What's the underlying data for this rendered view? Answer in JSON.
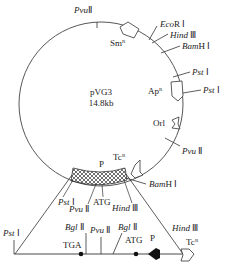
{
  "plasmid": {
    "name": "pVG3",
    "size": "14.8kb"
  },
  "circle_sites": [
    {
      "enzyme_italic": "Pvu",
      "suffix": "Ⅱ"
    },
    {
      "enzyme_italic": "Eco",
      "suffix": "R Ⅰ"
    },
    {
      "enzyme_italic": "Hind",
      "suffix": " Ⅲ"
    },
    {
      "enzyme_italic": "Bam",
      "suffix": "H Ⅰ"
    },
    {
      "enzyme_italic": "Pst",
      "suffix": " Ⅰ"
    },
    {
      "enzyme_italic": "Pst",
      "suffix": " Ⅰ"
    },
    {
      "enzyme_italic": "Pvu",
      "suffix": " Ⅱ"
    },
    {
      "enzyme_italic": "Bam",
      "suffix": "H Ⅰ"
    }
  ],
  "genes": {
    "sm": "Sm",
    "sm_sup": "R",
    "ap": "Ap",
    "ap_sup": "R",
    "ori": "Orl",
    "tc": "Tc",
    "tc_sup": "R",
    "promoter": "P"
  },
  "insert_sites": [
    {
      "enzyme_italic": "Pst",
      "suffix": " Ⅰ"
    },
    {
      "enzyme_italic": "Pvu",
      "suffix": " Ⅱ"
    },
    {
      "text": "ATG"
    },
    {
      "enzyme_italic": "Hind",
      "suffix": " Ⅲ"
    }
  ],
  "linear_map": {
    "sites": [
      {
        "enzyme_italic": "Pst",
        "suffix": " Ⅰ"
      },
      {
        "enzyme_italic": "Bgl",
        "suffix": " Ⅱ"
      },
      {
        "enzyme_italic": "Pvu",
        "suffix": " Ⅱ"
      },
      {
        "enzyme_italic": "Bgl",
        "suffix": " Ⅱ"
      },
      {
        "enzyme_italic": "Hind",
        "suffix": " Ⅲ"
      }
    ],
    "codons": {
      "stop": "TGA",
      "start": "ATG"
    },
    "promoter": "P",
    "tc": "Tc",
    "tc_sup": "R"
  }
}
